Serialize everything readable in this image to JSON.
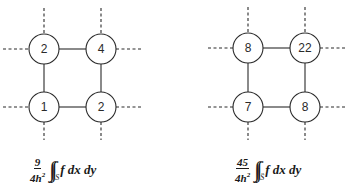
{
  "diagrams": [
    {
      "name": "stencil-left",
      "nodes": [
        {
          "label": "2",
          "cx": 44,
          "cy": 49
        },
        {
          "label": "4",
          "cx": 101,
          "cy": 49
        },
        {
          "label": "1",
          "cx": 44,
          "cy": 107
        },
        {
          "label": "2",
          "cx": 101,
          "cy": 107
        }
      ],
      "formula": {
        "numerator": "9",
        "denominator_base": "4h",
        "denominator_exp": "2",
        "integral": "∫∫",
        "domain": "S",
        "integrand": "f dx dy"
      }
    },
    {
      "name": "stencil-right",
      "nodes": [
        {
          "label": "8",
          "cx": 248,
          "cy": 48
        },
        {
          "label": "22",
          "cx": 305,
          "cy": 48
        },
        {
          "label": "7",
          "cx": 248,
          "cy": 107
        },
        {
          "label": "8",
          "cx": 305,
          "cy": 107
        }
      ],
      "formula": {
        "numerator": "45",
        "denominator_base": "4h",
        "denominator_exp": "2",
        "integral": "∫∫",
        "domain": "S̈",
        "integrand": "f dx dy"
      }
    }
  ],
  "colors": {
    "line": "#2a2a2a",
    "background": "#ffffff"
  }
}
